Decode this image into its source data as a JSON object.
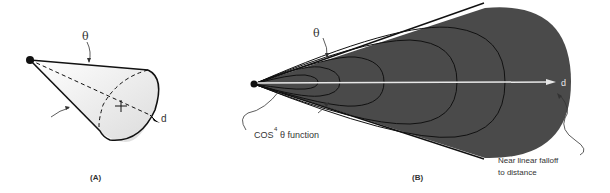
{
  "panel_a": {
    "caption": "(A)",
    "theta_label": "θ",
    "axis_label": "d"
  },
  "panel_b": {
    "caption": "(B)",
    "theta_label": "θ",
    "axis_label": "d",
    "cos_label_prefix": "COS",
    "cos_label_exponent": "4",
    "cos_label_suffix": "θ function",
    "falloff_label_line1": "Near linear falloff",
    "falloff_label_line2": "to distance"
  },
  "colors": {
    "fill_dark": "#4a4a4a",
    "line": "#111111",
    "axis_white": "#e8e8e8",
    "text": "#333333"
  }
}
